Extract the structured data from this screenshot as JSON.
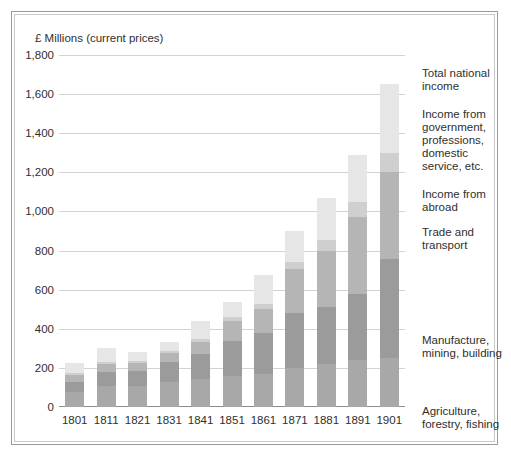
{
  "chart_data": {
    "type": "bar",
    "title": "",
    "subtitle": "",
    "axis_title": "£ Millions (current prices)",
    "xlabel": "",
    "ylabel": "£ Millions (current prices)",
    "ylim": [
      0,
      1800
    ],
    "ytick_step": 200,
    "grid": true,
    "stacked": true,
    "legend_position": "right",
    "categories": [
      "1801",
      "1811",
      "1821",
      "1831",
      "1841",
      "1851",
      "1861",
      "1871",
      "1881",
      "1891",
      "1901"
    ],
    "ytick_labels": [
      "0",
      "200",
      "400",
      "600",
      "800",
      "1,000",
      "1,200",
      "1,400",
      "1,600",
      "1,800"
    ],
    "series": [
      {
        "name": "Agriculture, forestry, fishing",
        "color": "#a8a8a8",
        "values": [
          75,
          105,
          110,
          130,
          145,
          160,
          170,
          200,
          220,
          240,
          250
        ]
      },
      {
        "name": "Manufacture, mining, building",
        "color": "#9b9b9b",
        "values": [
          55,
          75,
          75,
          100,
          125,
          180,
          210,
          280,
          290,
          340,
          505
        ]
      },
      {
        "name": "Trade and transport",
        "color": "#b5b5b5",
        "values": [
          35,
          40,
          40,
          45,
          65,
          100,
          120,
          225,
          290,
          390,
          445
        ]
      },
      {
        "name": "Income from abroad",
        "color": "#cfcfcf",
        "values": [
          10,
          10,
          10,
          10,
          15,
          20,
          25,
          35,
          55,
          80,
          100
        ]
      },
      {
        "name": "Income from government, professions, domestic service, etc.",
        "color": "#e6e6e6",
        "values": [
          50,
          70,
          45,
          50,
          90,
          75,
          150,
          160,
          215,
          240,
          350
        ]
      }
    ],
    "totals": [
      225,
      300,
      280,
      335,
      440,
      535,
      675,
      900,
      1070,
      1290,
      1650
    ],
    "legend_entries": [
      "Total national income",
      "Income from government, professions, domestic service, etc.",
      "Income from abroad",
      "Trade and transport",
      "Manufacture, mining, building",
      "Agriculture, forestry, fishing"
    ]
  },
  "legend": {
    "total_national_income": "Total national income",
    "income_from_government": "Income from government, professions, domestic service, etc.",
    "income_from_abroad": "Income from abroad",
    "trade_and_transport": "Trade and transport",
    "manufacture_mining_building": "Manufacture, mining, building",
    "agriculture_forestry_fishing": "Agriculture, forestry, fishing"
  }
}
